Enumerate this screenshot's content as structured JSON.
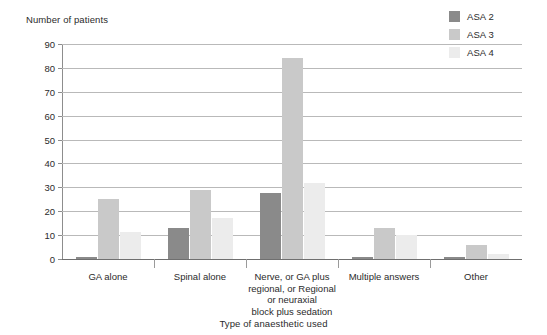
{
  "chart_data": {
    "type": "bar",
    "title": "",
    "xlabel": "Type of anaesthetic used",
    "ylabel": "Number of patients",
    "ylim": [
      0,
      90
    ],
    "ytick_step": 10,
    "yticks": [
      0,
      10,
      20,
      30,
      40,
      50,
      60,
      70,
      80,
      90
    ],
    "grid": true,
    "legend_position": "top-right",
    "categories": [
      "GA alone",
      "Spinal alone",
      "Nerve, or GA plus\nregional, or Regional\nor neuraxial\nblock plus sedation",
      "Multiple answers",
      "Other"
    ],
    "category_lines": [
      [
        "GA alone"
      ],
      [
        "Spinal alone"
      ],
      [
        "Nerve, or GA plus",
        "regional, or Regional",
        "or neuraxial",
        "block plus sedation"
      ],
      [
        "Multiple answers"
      ],
      [
        "Other"
      ]
    ],
    "series": [
      {
        "name": "ASA 2",
        "color": "#8a8a8a",
        "values": [
          1,
          13,
          27.5,
          1,
          1
        ]
      },
      {
        "name": "ASA 3",
        "color": "#c9c9c9",
        "values": [
          25,
          29,
          84,
          13,
          6
        ]
      },
      {
        "name": "ASA 4",
        "color": "#ececec",
        "values": [
          11.5,
          17,
          32,
          10,
          2
        ]
      }
    ]
  },
  "legend": {
    "items": [
      {
        "label": "ASA 2",
        "color": "#8a8a8a"
      },
      {
        "label": "ASA 3",
        "color": "#c9c9c9"
      },
      {
        "label": "ASA 4",
        "color": "#ececec"
      }
    ]
  },
  "axes": {
    "y_title": "Number of patients",
    "x_title": "Type of anaesthetic used"
  }
}
